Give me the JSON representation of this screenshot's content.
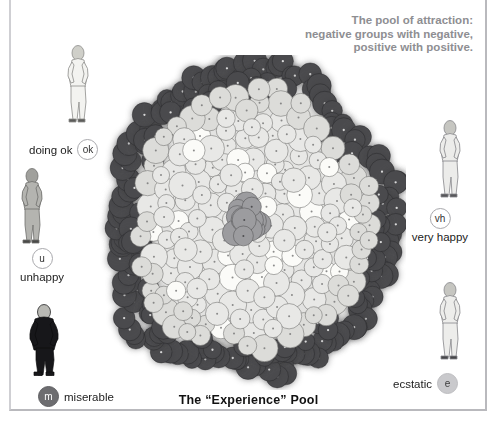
{
  "caption": {
    "line1": "The pool of attraction:",
    "line2": "negative groups with negative,",
    "line3": "positive with positive."
  },
  "pool": {
    "title": "The “Experience” Pool"
  },
  "legend": [
    {
      "key": "ok",
      "badge": "ok",
      "label": "doing ok",
      "badge_style": "open",
      "label_position": "left"
    },
    {
      "key": "u",
      "badge": "u",
      "label": "unhappy",
      "badge_style": "open",
      "label_position": "below"
    },
    {
      "key": "m",
      "badge": "m",
      "label": "miserable",
      "badge_style": "darkfill",
      "label_position": "right"
    },
    {
      "key": "vh",
      "badge": "vh",
      "label": "very happy",
      "badge_style": "open",
      "label_position": "below"
    },
    {
      "key": "e",
      "badge": "e",
      "label": "ecstatic",
      "badge_style": "lightfill",
      "label_position": "left"
    }
  ],
  "figures": [
    {
      "name": "figure-doing-ok",
      "tone": "light"
    },
    {
      "name": "figure-unhappy",
      "tone": "mid"
    },
    {
      "name": "figure-miserable",
      "tone": "dark"
    },
    {
      "name": "figure-very-happy",
      "tone": "light"
    },
    {
      "name": "figure-ecstatic",
      "tone": "light"
    }
  ],
  "chart_data": {
    "type": "scatter",
    "title": "The “Experience” Pool",
    "xlabel": "",
    "ylabel": "",
    "grid": false,
    "legend_position": "sides",
    "colors": {
      "dark_node": "#4a4a4d",
      "mid_node": "#9c9c9f",
      "light_node": "#e8e8e6",
      "bright_node": "#fbfbf8",
      "node_outline": "#70706f",
      "caption_text": "#8e8e92",
      "frame": "#b9b9bd"
    },
    "node_counts": {
      "dark_rim": 120,
      "mid": 18,
      "light_interior": 230,
      "total": 368
    },
    "series": [
      {
        "name": "negative (dark)",
        "count": 120,
        "region": "outer rim"
      },
      {
        "name": "neutral (mid gray)",
        "count": 18,
        "region": "center"
      },
      {
        "name": "positive (light)",
        "count": 230,
        "region": "interior"
      }
    ]
  }
}
